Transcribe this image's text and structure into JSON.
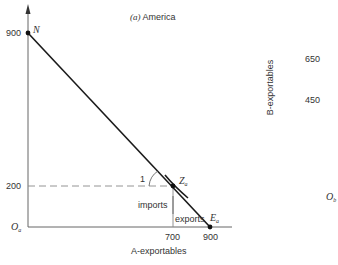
{
  "title": "(a) America",
  "title_prefix": "(a)",
  "title_country": "America",
  "x_axis": {
    "label": "A-exportables",
    "ticks": [
      "700",
      "900"
    ]
  },
  "y_axis": {
    "ticks": [
      "900",
      "200"
    ]
  },
  "origin_label": "O",
  "origin_sub": "a",
  "points": {
    "N": {
      "label": "N",
      "x": 0,
      "y": 900
    },
    "Z": {
      "label": "Z",
      "sub": "a",
      "x": 700,
      "y": 200
    },
    "E": {
      "label": "E",
      "sub": "a",
      "x": 900,
      "y": 0
    }
  },
  "annotations": {
    "slope": "1",
    "imports": "imports",
    "exports": "exports"
  },
  "right_panel": {
    "y_label": "B-exportables",
    "ticks": [
      "650",
      "450"
    ],
    "origin_label": "O",
    "origin_sub": "b"
  },
  "colors": {
    "line": "#1a1a1a",
    "axis": "#555555",
    "dashed": "#777777"
  }
}
